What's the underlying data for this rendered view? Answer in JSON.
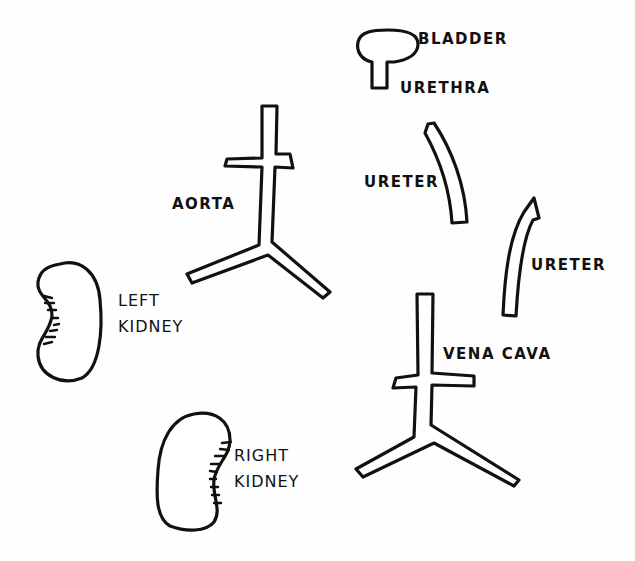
{
  "diagram": {
    "title": "",
    "parts": [
      {
        "id": "bladder",
        "label": "BLADDER"
      },
      {
        "id": "urethra",
        "label": "URETHRA"
      },
      {
        "id": "aorta",
        "label": "AORTA"
      },
      {
        "id": "ureter-1",
        "label": "URETER"
      },
      {
        "id": "ureter-2",
        "label": "URETER"
      },
      {
        "id": "left-kidney",
        "label_line1": "LEFT",
        "label_line2": "KIDNEY"
      },
      {
        "id": "vena-cava",
        "label": "VENA CAVA"
      },
      {
        "id": "right-kidney",
        "label_line1": "RIGHT",
        "label_line2": "KIDNEY"
      }
    ],
    "colors": {
      "ink": "#111111",
      "paper": "#fefefe"
    }
  }
}
